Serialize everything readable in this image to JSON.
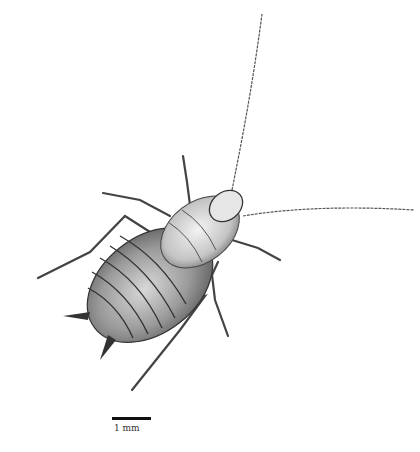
{
  "figure": {
    "style": "pencil stipple scientific illustration",
    "scale_bar": {
      "label": "1 mm",
      "color": "#111111"
    },
    "colors": {
      "background": "#ffffff",
      "ink": "#2a2a2a",
      "shade": "#8a8a8a",
      "light": "#e8e8e8"
    }
  }
}
